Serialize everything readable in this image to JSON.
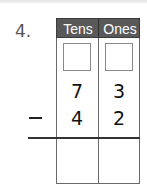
{
  "problem": {
    "number_label": "4.",
    "operation": "subtraction",
    "operator_symbol": "−",
    "columns": [
      "Tens",
      "Ones"
    ],
    "regroup_boxes": [
      "",
      ""
    ],
    "minuend": {
      "tens": "7",
      "ones": "3"
    },
    "subtrahend": {
      "tens": "4",
      "ones": "2"
    },
    "answer": {
      "tens": "",
      "ones": ""
    }
  },
  "colors": {
    "header_background": "#595959",
    "header_text": "#ffffff",
    "grid_lines": "#6a6a6a",
    "number_label": "#555555"
  }
}
